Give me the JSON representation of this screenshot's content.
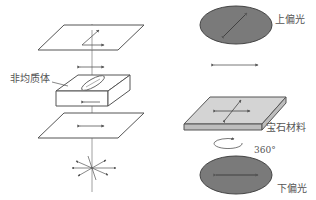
{
  "left_panel": {
    "inhomogeneous_label": "非均质体"
  },
  "right_panel": {
    "upper_polarizer_label": "上偏光",
    "gem_material_label": "宝石材料",
    "rotation_label": "360°",
    "lower_polarizer_label": "下偏光"
  },
  "colors": {
    "line": "#555555",
    "polarizer_fill": "#7a7a7a",
    "slab_fill": "#d4d4d4",
    "slab_edge": "#bdbdbd",
    "background": "#ffffff"
  }
}
